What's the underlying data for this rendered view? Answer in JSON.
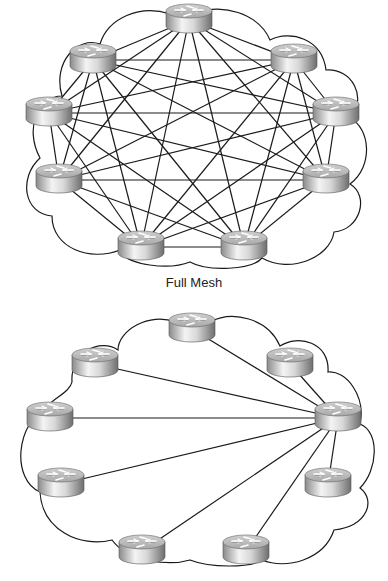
{
  "diagrams": [
    {
      "id": "full-mesh",
      "caption": "Full Mesh",
      "routers": [
        {
          "x": 189,
          "y": 20
        },
        {
          "x": 93,
          "y": 60
        },
        {
          "x": 294,
          "y": 60
        },
        {
          "x": 49,
          "y": 113
        },
        {
          "x": 336,
          "y": 113
        },
        {
          "x": 59,
          "y": 180
        },
        {
          "x": 326,
          "y": 180
        },
        {
          "x": 141,
          "y": 247
        },
        {
          "x": 244,
          "y": 247
        }
      ],
      "topology": "full-mesh",
      "cloud": "M170,14 C140,4 108,18 100,44 C78,36 52,62 62,96 C38,96 24,128 40,158 C18,178 24,214 52,216 C52,248 90,262 120,250 C126,266 170,270 190,262 C208,272 252,270 262,258 C290,274 330,258 334,232 C360,230 370,196 350,184 C374,166 370,128 350,118 C368,98 352,68 326,70 C322,38 290,30 270,40 C258,12 220,4 200,12 Z"
    },
    {
      "id": "partial-mesh",
      "caption": "",
      "routers": [
        {
          "x": 192,
          "y": 329
        },
        {
          "x": 95,
          "y": 364
        },
        {
          "x": 290,
          "y": 364
        },
        {
          "x": 50,
          "y": 418
        },
        {
          "x": 338,
          "y": 418
        },
        {
          "x": 61,
          "y": 484
        },
        {
          "x": 328,
          "y": 484
        },
        {
          "x": 142,
          "y": 551
        },
        {
          "x": 246,
          "y": 551
        }
      ],
      "topology": "hub",
      "hub_index": 4,
      "cloud": "M175,322 C150,312 118,330 118,350 C100,338 70,352 72,382 C70,392 54,398 50,404 C14,424 12,480 40,492 C42,530 80,548 112,540 C128,562 170,566 190,560 C210,568 250,568 262,560 C286,570 324,560 334,530 C368,526 376,500 360,488 C378,470 380,432 360,424 C366,396 346,370 328,372 C330,342 298,334 280,346 C268,318 232,310 210,322 Z"
    }
  ],
  "colors": {
    "line": "#1a1a1a",
    "router_top": "#d6d6d6",
    "router_body_light": "#f2f2f2",
    "router_body_dark": "#7c7c7c",
    "router_arrows": "#ffffff"
  },
  "router_icon": "router-icon"
}
